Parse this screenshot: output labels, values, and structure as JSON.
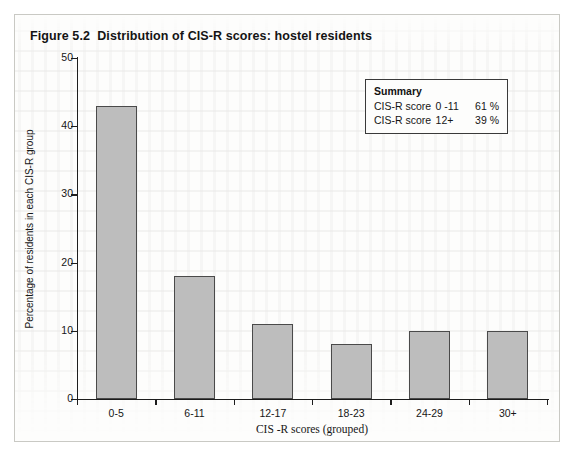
{
  "figure": {
    "title": "Figure 5.2  Distribution of CIS-R scores: hostel residents"
  },
  "summary": {
    "heading": "Summary",
    "rows": [
      {
        "label": "CIS-R score",
        "range": "0 -11",
        "percent": "61 %"
      },
      {
        "label": "CIS-R score",
        "range": "12+",
        "percent": "39 %"
      }
    ]
  },
  "chart_data": {
    "type": "bar",
    "title": "Figure 5.2  Distribution of CIS-R scores: hostel residents",
    "xlabel": "CIS -R scores (grouped)",
    "ylabel": "Percentage of residents in each CIS-R group",
    "categories": [
      "0-5",
      "6-11",
      "12-17",
      "18-23",
      "24-29",
      "30+"
    ],
    "values": [
      43,
      18,
      11,
      8,
      10,
      10
    ],
    "ylim": [
      0,
      50
    ],
    "yticks": [
      0,
      10,
      20,
      30,
      40,
      50
    ],
    "ytick_labels": [
      "0",
      "10",
      "20",
      "30",
      "40",
      "50"
    ],
    "grid": false,
    "legend": "none",
    "bar_color": "#bdbdbd",
    "bar_edge_color": "#4a4a4a",
    "annotations": [
      "Summary: CIS-R score 0 -11 = 61 %; CIS-R score 12+ = 39 %"
    ]
  }
}
